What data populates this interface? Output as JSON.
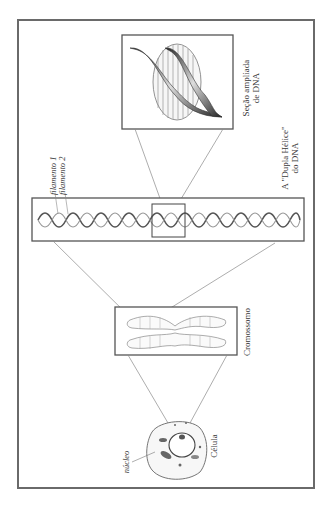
{
  "diagram": {
    "orientation": "rotated-90-ccw",
    "colors": {
      "frame": "#6a6a6a",
      "lines": "#8a8a8a",
      "ink": "#3a3a3a",
      "background": "#ffffff"
    },
    "panels": [
      {
        "id": "dna-section",
        "label_lines": [
          "Seção ampliada",
          "de DNA"
        ]
      },
      {
        "id": "double-helix",
        "label_lines": [
          "A \"Dupla Hélice\"",
          "do DNA"
        ],
        "strand_labels": [
          "filamento 1",
          "filamento 2"
        ]
      },
      {
        "id": "chromosome",
        "label_lines": [
          "Cromossomo"
        ]
      },
      {
        "id": "cell",
        "label_lines": [
          "Célula"
        ],
        "part_labels": [
          "núcleo"
        ]
      }
    ]
  }
}
